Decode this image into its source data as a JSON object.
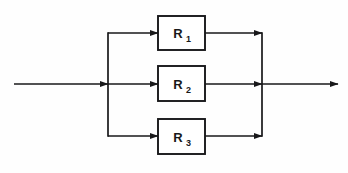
{
  "diagram": {
    "type": "block-diagram",
    "background_color": "#fefefe",
    "line_color": "#18181a",
    "line_width": 1.6,
    "canvas": {
      "width": 348,
      "height": 173
    },
    "input": {
      "name": "input-line",
      "label": "",
      "from_x": 14,
      "to_x": 108,
      "y": 84,
      "arrow": true
    },
    "output": {
      "name": "output-line",
      "label": "",
      "from_x": 262,
      "to_x": 338,
      "y": 84,
      "arrow": true
    },
    "split_bus": {
      "name": "input-split-bus",
      "x": 108,
      "top_y": 33,
      "bottom_y": 136
    },
    "merge_bus": {
      "name": "output-merge-bus",
      "x": 262,
      "top_y": 33,
      "bottom_y": 136
    },
    "blocks": [
      {
        "id": "r1",
        "label": "R",
        "subscript": "1",
        "full_label": "R1",
        "x": 158,
        "y": 16,
        "width": 47,
        "height": 34,
        "branch_y": 33
      },
      {
        "id": "r2",
        "label": "R",
        "subscript": "2",
        "full_label": "R2",
        "x": 158,
        "y": 66,
        "width": 47,
        "height": 35,
        "branch_y": 84
      },
      {
        "id": "r3",
        "label": "R",
        "subscript": "3",
        "full_label": "R3",
        "x": 158,
        "y": 119,
        "width": 47,
        "height": 35,
        "branch_y": 136
      }
    ]
  }
}
